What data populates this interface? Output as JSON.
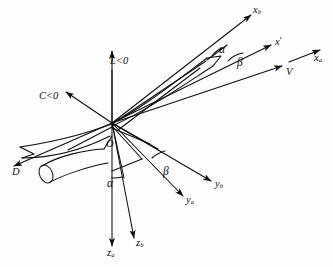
{
  "figure": {
    "kind": "line-diagram",
    "background_color": "#ffffff",
    "stroke_color": "#0d0d0d"
  },
  "origin": {
    "label": "O"
  },
  "axes": [
    {
      "name": "x-body",
      "symbol": "x",
      "subscript": "b",
      "label": "xb",
      "x": 253,
      "y": 10
    },
    {
      "name": "x-prime",
      "symbol": "x",
      "subscript": "",
      "label": "x'",
      "x": 275,
      "y": 42
    },
    {
      "name": "x-air-path",
      "symbol": "x",
      "subscript": "a",
      "label": "xa",
      "x": 314,
      "y": 58
    },
    {
      "name": "y-body",
      "symbol": "y",
      "subscript": "b",
      "label": "yb",
      "x": 215,
      "y": 184
    },
    {
      "name": "y-air-path",
      "symbol": "y",
      "subscript": "a",
      "label": "ya",
      "x": 186,
      "y": 200
    },
    {
      "name": "z-body",
      "symbol": "z",
      "subscript": "b",
      "label": "zb",
      "x": 136,
      "y": 243
    },
    {
      "name": "z-air-path",
      "symbol": "z",
      "subscript": "a",
      "label": "za",
      "x": 107,
      "y": 250
    }
  ],
  "vectors": [
    {
      "name": "velocity",
      "label": "V",
      "x": 286,
      "y": 72
    },
    {
      "name": "lift",
      "label": "L<0",
      "x": 110,
      "y": 61
    },
    {
      "name": "side-force",
      "label": "C<0",
      "x": 39,
      "y": 96
    },
    {
      "name": "drag",
      "label": "D",
      "x": 12,
      "y": 172
    }
  ],
  "angles": [
    {
      "name": "alpha-upper",
      "label": "α",
      "between": "xb and x'",
      "x": 219,
      "y": 50
    },
    {
      "name": "beta-upper",
      "label": "β",
      "between": "x' and V",
      "x": 237,
      "y": 62
    },
    {
      "name": "beta-lower",
      "label": "β",
      "between": "ya and yb",
      "x": 163,
      "y": 171
    },
    {
      "name": "alpha-lower",
      "label": "α",
      "between": "za and zb",
      "x": 107,
      "y": 183
    }
  ]
}
